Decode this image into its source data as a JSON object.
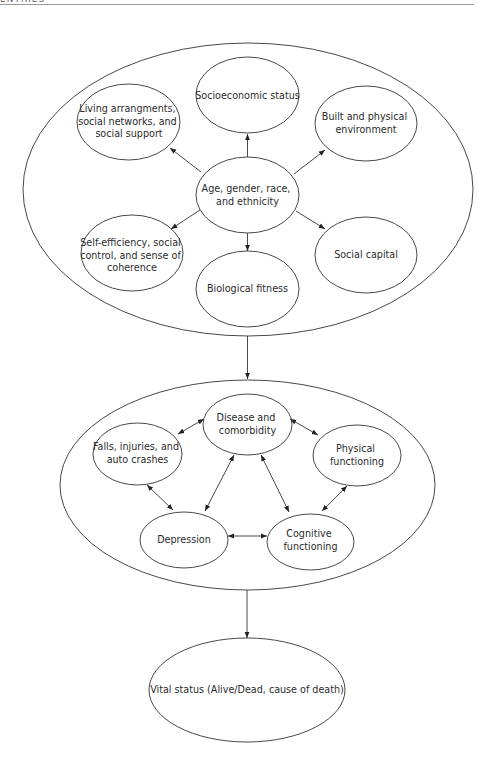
{
  "header": {
    "running_head": "ENTRIES"
  },
  "diagram": {
    "stroke_color": "#333333",
    "groups": [
      {
        "id": "determinants",
        "center": {
          "id": "age",
          "lines": [
            "Age, gender, race,",
            "and ethnicity"
          ]
        },
        "nodes": [
          {
            "id": "ses",
            "lines": [
              "Socioeconomic status"
            ]
          },
          {
            "id": "living",
            "lines": [
              "Living arrangments,",
              "social networks, and",
              "social support"
            ]
          },
          {
            "id": "built",
            "lines": [
              "Built and physical",
              "environment"
            ]
          },
          {
            "id": "self",
            "lines": [
              "Self-efficiency, social",
              "control, and sense of",
              "coherence"
            ]
          },
          {
            "id": "bio",
            "lines": [
              "Biological fitness"
            ]
          },
          {
            "id": "capital",
            "lines": [
              "Social capital"
            ]
          }
        ]
      },
      {
        "id": "health",
        "nodes": [
          {
            "id": "disease",
            "lines": [
              "Disease and",
              "comorbidity"
            ]
          },
          {
            "id": "falls",
            "lines": [
              "Falls, injuries, and",
              "auto crashes"
            ]
          },
          {
            "id": "physical",
            "lines": [
              "Physical",
              "functioning"
            ]
          },
          {
            "id": "depression",
            "lines": [
              "Depression"
            ]
          },
          {
            "id": "cognitive",
            "lines": [
              "Cognitive",
              "functioning"
            ]
          }
        ]
      },
      {
        "id": "outcome",
        "nodes": [
          {
            "id": "vital",
            "lines": [
              "Vital status (Alive/Dead, cause of death)"
            ]
          }
        ]
      }
    ],
    "edges": [
      {
        "from": "age",
        "to": "ses",
        "type": "directed"
      },
      {
        "from": "age",
        "to": "living",
        "type": "directed"
      },
      {
        "from": "age",
        "to": "built",
        "type": "directed"
      },
      {
        "from": "age",
        "to": "self",
        "type": "directed"
      },
      {
        "from": "age",
        "to": "bio",
        "type": "directed"
      },
      {
        "from": "age",
        "to": "capital",
        "type": "directed"
      },
      {
        "from": "determinants",
        "to": "health",
        "type": "directed"
      },
      {
        "from": "disease",
        "to": "falls",
        "type": "bidirectional"
      },
      {
        "from": "disease",
        "to": "physical",
        "type": "bidirectional"
      },
      {
        "from": "disease",
        "to": "depression",
        "type": "bidirectional"
      },
      {
        "from": "disease",
        "to": "cognitive",
        "type": "bidirectional"
      },
      {
        "from": "falls",
        "to": "depression",
        "type": "bidirectional"
      },
      {
        "from": "physical",
        "to": "cognitive",
        "type": "bidirectional"
      },
      {
        "from": "depression",
        "to": "cognitive",
        "type": "bidirectional"
      },
      {
        "from": "health",
        "to": "vital",
        "type": "directed"
      }
    ]
  }
}
